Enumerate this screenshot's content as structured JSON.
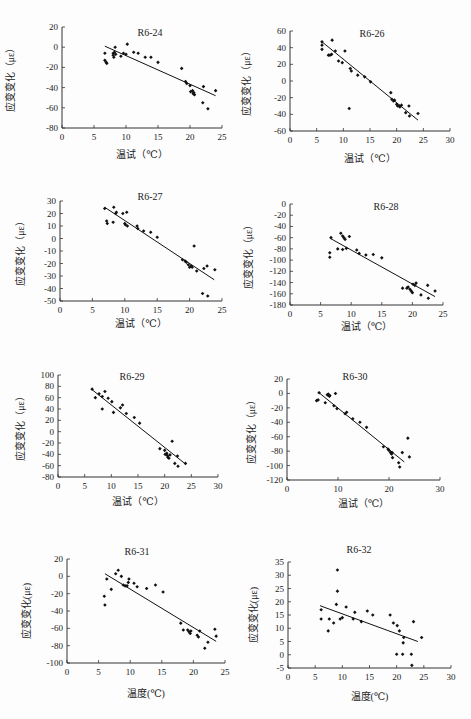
{
  "figure": {
    "width": 471,
    "height": 719,
    "colors": {
      "axis": "#333333",
      "point": "#111111",
      "line": "#111111",
      "background": "#fdfdfd"
    }
  },
  "chart_data": [
    {
      "type": "scatter",
      "title": "R6-24",
      "xlabel": "温试（℃）",
      "ylabel": "应变变化（με）",
      "xlim": [
        0,
        25
      ],
      "ylim": [
        -80,
        20
      ],
      "xticks": [
        0,
        5,
        10,
        15,
        20,
        25
      ],
      "yticks": [
        20,
        0,
        -20,
        -40,
        -60,
        -80
      ],
      "grid": false,
      "layout": {
        "x0": 62,
        "x1": 222,
        "ytop": 27,
        "ybot": 128,
        "title_x": 150,
        "title_y": 36,
        "xlabel_y": 158,
        "ylabel_x": 14
      },
      "points": [
        [
          6.7,
          -6
        ],
        [
          6.7,
          -13
        ],
        [
          6.9,
          -15
        ],
        [
          7.0,
          -16
        ],
        [
          8.0,
          -6
        ],
        [
          8.0,
          -8
        ],
        [
          8.1,
          -10
        ],
        [
          8.2,
          -5
        ],
        [
          8.3,
          0
        ],
        [
          8.4,
          -7
        ],
        [
          9.2,
          -9
        ],
        [
          9.6,
          -6
        ],
        [
          10.0,
          -7
        ],
        [
          10.2,
          3
        ],
        [
          11.2,
          -5
        ],
        [
          11.9,
          -6
        ],
        [
          13.0,
          -10
        ],
        [
          13.9,
          -10
        ],
        [
          15.0,
          -15
        ],
        [
          18.7,
          -21
        ],
        [
          19.3,
          -34
        ],
        [
          19.5,
          -36
        ],
        [
          20.0,
          -38
        ],
        [
          20.1,
          -44
        ],
        [
          20.4,
          -43
        ],
        [
          20.5,
          -46
        ],
        [
          20.7,
          -47
        ],
        [
          20.6,
          -45
        ],
        [
          22.0,
          -55
        ],
        [
          22.1,
          -39
        ],
        [
          22.8,
          -61
        ],
        [
          24.0,
          -43
        ]
      ],
      "trendline": {
        "x": [
          6.7,
          24.0
        ],
        "y": [
          1,
          -48
        ]
      }
    },
    {
      "type": "scatter",
      "title": "R6-26",
      "xlabel": "温试（℃）",
      "ylabel": "应变变化（με）",
      "xlim": [
        0,
        30
      ],
      "ylim": [
        -60,
        60
      ],
      "xticks": [
        0,
        5,
        10,
        15,
        20,
        25,
        30
      ],
      "yticks": [
        60,
        40,
        20,
        0,
        -20,
        -40,
        -60
      ],
      "grid": false,
      "layout": {
        "x0": 290,
        "x1": 450,
        "ytop": 31,
        "ybot": 131,
        "title_x": 372,
        "title_y": 37,
        "xlabel_y": 162,
        "ylabel_x": 250
      },
      "points": [
        [
          6.0,
          47
        ],
        [
          6.0,
          43
        ],
        [
          6.0,
          38
        ],
        [
          7.2,
          31
        ],
        [
          7.5,
          31
        ],
        [
          7.8,
          32
        ],
        [
          7.9,
          49
        ],
        [
          8.5,
          36
        ],
        [
          9.1,
          24
        ],
        [
          9.8,
          22
        ],
        [
          10.3,
          36
        ],
        [
          11.3,
          15
        ],
        [
          11.5,
          12
        ],
        [
          12.7,
          7
        ],
        [
          14.0,
          5
        ],
        [
          15.1,
          -1
        ],
        [
          11.1,
          -33
        ],
        [
          18.9,
          -14
        ],
        [
          19.1,
          -22
        ],
        [
          19.4,
          -24
        ],
        [
          19.6,
          -23
        ],
        [
          20.0,
          -28
        ],
        [
          20.2,
          -30
        ],
        [
          20.5,
          -30
        ],
        [
          20.9,
          -29
        ],
        [
          20.6,
          -31
        ],
        [
          21.7,
          -38
        ],
        [
          22.3,
          -30
        ],
        [
          22.4,
          -42
        ],
        [
          24.0,
          -39
        ]
      ],
      "trendline": {
        "x": [
          6.0,
          24.0
        ],
        "y": [
          47,
          -47
        ]
      }
    },
    {
      "type": "scatter",
      "title": "R6-27",
      "xlabel": "温试（℃）",
      "ylabel": "应变变化（με）",
      "xlim": [
        0,
        25
      ],
      "ylim": [
        -50,
        30
      ],
      "xticks": [
        0,
        5,
        10,
        15,
        20,
        25
      ],
      "yticks": [
        30,
        20,
        10,
        0,
        -10,
        -20,
        -30,
        -40,
        -50
      ],
      "grid": false,
      "layout": {
        "x0": 60,
        "x1": 222,
        "ytop": 201,
        "ybot": 301,
        "title_x": 150,
        "title_y": 200,
        "xlabel_y": 327,
        "ylabel_x": 24
      },
      "points": [
        [
          6.9,
          24
        ],
        [
          7.2,
          14
        ],
        [
          7.3,
          12
        ],
        [
          8.2,
          13
        ],
        [
          8.3,
          25
        ],
        [
          8.6,
          20
        ],
        [
          8.7,
          21
        ],
        [
          9.7,
          20
        ],
        [
          10.0,
          12
        ],
        [
          10.3,
          21
        ],
        [
          10.4,
          10
        ],
        [
          10.1,
          11
        ],
        [
          11.9,
          10
        ],
        [
          12.0,
          8
        ],
        [
          12.9,
          6
        ],
        [
          14.0,
          5
        ],
        [
          15.0,
          1
        ],
        [
          18.9,
          -17
        ],
        [
          19.3,
          -18
        ],
        [
          19.5,
          -19
        ],
        [
          19.8,
          -21
        ],
        [
          20.0,
          -23
        ],
        [
          20.2,
          -22
        ],
        [
          20.4,
          -23
        ],
        [
          20.7,
          -6
        ],
        [
          21.1,
          -26
        ],
        [
          22.0,
          -44
        ],
        [
          22.2,
          -24
        ],
        [
          22.7,
          -22
        ],
        [
          22.8,
          -46
        ],
        [
          23.9,
          -25
        ]
      ],
      "trendline": {
        "x": [
          6.9,
          23.8
        ],
        "y": [
          25,
          -33
        ]
      }
    },
    {
      "type": "scatter",
      "title": "R6-28",
      "xlabel": "温试（℃）",
      "ylabel": "应变变化（με）",
      "xlim": [
        0,
        25
      ],
      "ylim": [
        -180,
        0
      ],
      "xticks": [
        0,
        5,
        10,
        15,
        20,
        25
      ],
      "yticks": [
        0,
        -20,
        -40,
        -60,
        -80,
        -100,
        -120,
        -140,
        -160,
        -180
      ],
      "grid": false,
      "layout": {
        "x0": 290,
        "x1": 443,
        "ytop": 204,
        "ybot": 305,
        "title_x": 386,
        "title_y": 210,
        "xlabel_y": 330,
        "ylabel_x": 252
      },
      "points": [
        [
          6.5,
          -87
        ],
        [
          6.5,
          -95
        ],
        [
          6.7,
          -60
        ],
        [
          7.8,
          -80
        ],
        [
          8.3,
          -52
        ],
        [
          8.6,
          -81
        ],
        [
          8.6,
          -57
        ],
        [
          8.8,
          -60
        ],
        [
          9.0,
          -63
        ],
        [
          9.2,
          -79
        ],
        [
          9.7,
          -58
        ],
        [
          10.9,
          -82
        ],
        [
          11.3,
          -88
        ],
        [
          12.4,
          -91
        ],
        [
          13.6,
          -90
        ],
        [
          15.0,
          -96
        ],
        [
          18.4,
          -150
        ],
        [
          19.1,
          -150
        ],
        [
          19.3,
          -148
        ],
        [
          19.6,
          -152
        ],
        [
          19.8,
          -155
        ],
        [
          20.0,
          -158
        ],
        [
          20.1,
          -143
        ],
        [
          20.4,
          -145
        ],
        [
          20.6,
          -141
        ],
        [
          21.4,
          -162
        ],
        [
          22.5,
          -145
        ],
        [
          22.6,
          -168
        ],
        [
          23.7,
          -155
        ]
      ],
      "trendline": {
        "x": [
          6.7,
          23.7
        ],
        "y": [
          -62,
          -165
        ]
      }
    },
    {
      "type": "scatter",
      "title": "R6-29",
      "xlabel": "温试（℃）",
      "ylabel": "应变变化（με）",
      "xlim": [
        0,
        30
      ],
      "ylim": [
        -80,
        100
      ],
      "xticks": [
        0,
        5,
        10,
        15,
        20,
        25,
        30
      ],
      "yticks": [
        100,
        80,
        60,
        40,
        20,
        0,
        -20,
        -40,
        -60,
        -80
      ],
      "grid": false,
      "layout": {
        "x0": 58,
        "x1": 218,
        "ytop": 375,
        "ybot": 477,
        "title_x": 132,
        "title_y": 380,
        "xlabel_y": 505,
        "ylabel_x": 24
      },
      "points": [
        [
          6.4,
          75
        ],
        [
          7.0,
          60
        ],
        [
          7.7,
          67
        ],
        [
          8.3,
          62
        ],
        [
          8.3,
          40
        ],
        [
          8.8,
          71
        ],
        [
          9.4,
          59
        ],
        [
          10.1,
          53
        ],
        [
          10.4,
          34
        ],
        [
          11.7,
          42
        ],
        [
          12.1,
          47
        ],
        [
          12.8,
          32
        ],
        [
          14.3,
          25
        ],
        [
          15.3,
          15
        ],
        [
          19.1,
          -30
        ],
        [
          20.0,
          -33
        ],
        [
          20.1,
          -40
        ],
        [
          20.4,
          -38
        ],
        [
          20.5,
          -42
        ],
        [
          20.6,
          -45
        ],
        [
          20.8,
          -47
        ],
        [
          21.0,
          -41
        ],
        [
          21.4,
          -17
        ],
        [
          21.9,
          -56
        ],
        [
          22.4,
          -43
        ],
        [
          22.5,
          -61
        ],
        [
          23.9,
          -56
        ]
      ],
      "trendline": {
        "x": [
          6.4,
          23.9
        ],
        "y": [
          74,
          -57
        ]
      }
    },
    {
      "type": "scatter",
      "title": "R6-30",
      "xlabel": "温试（℃）",
      "ylabel": "应变变化（με）",
      "xlim": [
        0,
        30
      ],
      "ylim": [
        -120,
        20
      ],
      "xticks": [
        0,
        10,
        20,
        30
      ],
      "yticks": [
        20,
        0,
        -20,
        -40,
        -60,
        -80,
        -100,
        -120
      ],
      "grid": false,
      "layout": {
        "x0": 287,
        "x1": 440,
        "ytop": 379,
        "ybot": 480,
        "title_x": 355,
        "title_y": 380,
        "xlabel_y": 507,
        "ylabel_x": 255
      },
      "points": [
        [
          5.8,
          -10
        ],
        [
          6.1,
          -9
        ],
        [
          6.3,
          1
        ],
        [
          7.5,
          -13
        ],
        [
          7.9,
          -2
        ],
        [
          8.1,
          -1
        ],
        [
          8.3,
          -4
        ],
        [
          8.4,
          -3
        ],
        [
          9.2,
          -17
        ],
        [
          9.5,
          0
        ],
        [
          9.8,
          -21
        ],
        [
          11.4,
          -28
        ],
        [
          11.7,
          -26
        ],
        [
          12.9,
          -35
        ],
        [
          14.3,
          -40
        ],
        [
          15.6,
          -47
        ],
        [
          18.9,
          -74
        ],
        [
          19.8,
          -77
        ],
        [
          20.0,
          -79
        ],
        [
          20.3,
          -82
        ],
        [
          20.5,
          -84
        ],
        [
          20.7,
          -89
        ],
        [
          20.6,
          -82
        ],
        [
          21.9,
          -96
        ],
        [
          22.1,
          -102
        ],
        [
          22.6,
          -82
        ],
        [
          23.7,
          -62
        ],
        [
          24.0,
          -88
        ]
      ],
      "trendline": {
        "x": [
          6.1,
          23.0
        ],
        "y": [
          2,
          -95
        ]
      }
    },
    {
      "type": "scatter",
      "title": "R6-31",
      "xlabel": "温度(℃)",
      "ylabel": "应变变化(με)",
      "xlim": [
        0,
        25
      ],
      "ylim": [
        -100,
        20
      ],
      "xticks": [
        0,
        5,
        10,
        15,
        20,
        25
      ],
      "yticks": [
        20,
        0,
        -20,
        -40,
        -60,
        -80,
        -100
      ],
      "grid": false,
      "layout": {
        "x0": 67,
        "x1": 225,
        "ytop": 559,
        "ybot": 663,
        "title_x": 137,
        "title_y": 555,
        "xlabel_y": 697,
        "ylabel_x": 30
      },
      "points": [
        [
          5.9,
          -23
        ],
        [
          6.0,
          -33
        ],
        [
          6.3,
          -3
        ],
        [
          7.0,
          -15
        ],
        [
          7.7,
          3
        ],
        [
          8.1,
          7
        ],
        [
          8.6,
          0
        ],
        [
          8.9,
          -10
        ],
        [
          9.2,
          -11
        ],
        [
          9.5,
          -11
        ],
        [
          9.7,
          -7
        ],
        [
          9.8,
          -3
        ],
        [
          10.6,
          -8
        ],
        [
          11.1,
          -12
        ],
        [
          12.6,
          -14
        ],
        [
          14.0,
          -10
        ],
        [
          15.2,
          -18
        ],
        [
          18.0,
          -54
        ],
        [
          18.4,
          -62
        ],
        [
          19.1,
          -62
        ],
        [
          19.3,
          -64
        ],
        [
          19.5,
          -66
        ],
        [
          19.6,
          -63
        ],
        [
          20.6,
          -68
        ],
        [
          20.8,
          -70
        ],
        [
          21.0,
          -63
        ],
        [
          21.8,
          -83
        ],
        [
          22.3,
          -76
        ],
        [
          23.4,
          -61
        ],
        [
          23.6,
          -69
        ]
      ],
      "trendline": {
        "x": [
          6.0,
          23.6
        ],
        "y": [
          3,
          -75
        ]
      }
    },
    {
      "type": "scatter",
      "title": "R6-32",
      "xlabel": "温度(℃)",
      "ylabel": "应变变化(με)",
      "xlim": [
        0,
        30
      ],
      "ylim": [
        -5,
        35
      ],
      "xticks": [
        0,
        5,
        10,
        15,
        20,
        25,
        30
      ],
      "yticks": [
        35,
        30,
        25,
        20,
        15,
        10,
        5,
        0,
        -5
      ],
      "grid": false,
      "layout": {
        "x0": 288,
        "x1": 451,
        "ytop": 562,
        "ybot": 668,
        "title_x": 359,
        "title_y": 553,
        "xlabel_y": 700,
        "ylabel_x": 257
      },
      "points": [
        [
          6.1,
          17
        ],
        [
          6.1,
          13.5
        ],
        [
          7.4,
          9
        ],
        [
          7.6,
          13.5
        ],
        [
          8.4,
          12
        ],
        [
          8.9,
          19
        ],
        [
          9.1,
          32
        ],
        [
          9.1,
          24
        ],
        [
          9.6,
          13.5
        ],
        [
          10.0,
          14
        ],
        [
          10.7,
          18
        ],
        [
          12.0,
          13.5
        ],
        [
          12.3,
          16
        ],
        [
          13.5,
          12.5
        ],
        [
          14.6,
          16.5
        ],
        [
          15.6,
          15
        ],
        [
          18.8,
          15
        ],
        [
          19.4,
          12
        ],
        [
          20.0,
          0.2
        ],
        [
          20.1,
          11
        ],
        [
          20.5,
          9
        ],
        [
          21.1,
          0.2
        ],
        [
          21.2,
          4.5
        ],
        [
          21.3,
          6.5
        ],
        [
          22.7,
          0.2
        ],
        [
          22.8,
          -4
        ],
        [
          23.1,
          12.5
        ],
        [
          24.6,
          6.5
        ]
      ],
      "trendline": {
        "x": [
          5.9,
          23.9
        ],
        "y": [
          18.5,
          5
        ]
      }
    }
  ]
}
